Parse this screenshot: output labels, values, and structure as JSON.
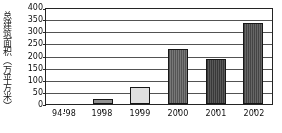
{
  "chart_data": {
    "type": "bar",
    "title": "",
    "xlabel": "",
    "ylabel": "总建筑面积（万平方米）",
    "categories": [
      "94-98",
      "1998",
      "1999",
      "2000",
      "2001",
      "2002"
    ],
    "values": [
      0,
      22,
      72,
      225,
      185,
      335
    ],
    "series": [
      {
        "name": "总建筑面积",
        "values": [
          0,
          22,
          72,
          225,
          185,
          335
        ]
      }
    ],
    "ylim": [
      0,
      400
    ],
    "ytick_values": [
      0,
      50,
      100,
      150,
      200,
      250,
      300,
      350,
      400
    ],
    "ytick_labels": [
      "0",
      "50",
      "100",
      "150",
      "200",
      "250",
      "300",
      "350",
      "400"
    ],
    "grid": true,
    "legend": "none",
    "bar_colors": [
      "#bdbdbd",
      "#8f8f8f",
      "#d8d8d8",
      "#6a6a6a",
      "#4a4a4a",
      "#585858"
    ],
    "axis_color": "#2b2b2b",
    "grid_color": "#555555",
    "plot_background": "#ffffff"
  },
  "axis": {
    "y_title": "总建筑面积（万平方米）"
  }
}
